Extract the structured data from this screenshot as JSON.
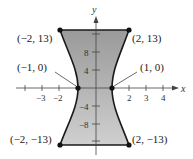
{
  "axes": {
    "x_label": "x",
    "y_label": "y",
    "x_ticks": [
      {
        "label": "−3",
        "value": -3
      },
      {
        "label": "−2",
        "value": -2
      },
      {
        "label": "2",
        "value": 2
      },
      {
        "label": "3",
        "value": 3
      },
      {
        "label": "4",
        "value": 4
      }
    ],
    "y_ticks": [
      {
        "label": "8",
        "value": 8
      },
      {
        "label": "4",
        "value": 4
      },
      {
        "label": "−4",
        "value": -4
      },
      {
        "label": "−8",
        "value": -8
      }
    ]
  },
  "points": [
    {
      "label": "(−2, 13)",
      "x": -2,
      "y": 13
    },
    {
      "label": "(2, 13)",
      "x": 2,
      "y": 13
    },
    {
      "label": "(−1, 0)",
      "x": -1,
      "y": 0
    },
    {
      "label": "(1, 0)",
      "x": 1,
      "y": 0
    },
    {
      "label": "(−2, −13)",
      "x": -2,
      "y": -13
    },
    {
      "label": "(2, −13)",
      "x": 2,
      "y": -13
    }
  ],
  "colors": {
    "fill_top": "#8a8a8a",
    "fill_bottom": "#c8c8c8",
    "curve": "#1a1a1a"
  }
}
